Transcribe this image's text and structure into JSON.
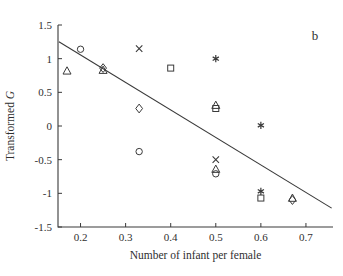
{
  "panel": {
    "label": "b"
  },
  "chart_data": {
    "type": "scatter",
    "title": "",
    "xlabel": "Number of infant per female",
    "ylabel": "Transformed G",
    "ylabel_plain": "Transformed",
    "ylabel_italic": "G",
    "xlim": [
      0.15,
      0.76
    ],
    "ylim": [
      -1.5,
      1.5
    ],
    "xticks": [
      0.2,
      0.3,
      0.4,
      0.5,
      0.6,
      0.7
    ],
    "xticklabels": [
      "0.2",
      "0.3",
      "0.4",
      "0.5",
      "0.6",
      "0.7"
    ],
    "yticks": [
      -1.5,
      -1,
      -0.5,
      0,
      0.5,
      1,
      1.5
    ],
    "yticklabels": [
      "-1.5",
      "-1",
      "-0.5",
      "0",
      "0.5",
      "1",
      "1.5"
    ],
    "grid": false,
    "legend": false,
    "points": [
      {
        "x": 0.17,
        "y": 0.82,
        "marker": "triangle"
      },
      {
        "x": 0.2,
        "y": 1.14,
        "marker": "circle"
      },
      {
        "x": 0.25,
        "y": 0.86,
        "marker": "diamond"
      },
      {
        "x": 0.25,
        "y": 0.83,
        "marker": "triangle"
      },
      {
        "x": 0.33,
        "y": 1.15,
        "marker": "cross"
      },
      {
        "x": 0.33,
        "y": 0.26,
        "marker": "diamond"
      },
      {
        "x": 0.33,
        "y": -0.38,
        "marker": "circle"
      },
      {
        "x": 0.4,
        "y": 0.86,
        "marker": "square"
      },
      {
        "x": 0.5,
        "y": 1.0,
        "marker": "asterisk"
      },
      {
        "x": 0.5,
        "y": 0.31,
        "marker": "triangle"
      },
      {
        "x": 0.5,
        "y": 0.26,
        "marker": "square"
      },
      {
        "x": 0.5,
        "y": -0.5,
        "marker": "cross"
      },
      {
        "x": 0.5,
        "y": -0.64,
        "marker": "triangle"
      },
      {
        "x": 0.5,
        "y": -0.71,
        "marker": "circle"
      },
      {
        "x": 0.6,
        "y": 0.01,
        "marker": "asterisk"
      },
      {
        "x": 0.6,
        "y": -0.97,
        "marker": "asterisk"
      },
      {
        "x": 0.6,
        "y": -1.07,
        "marker": "square"
      },
      {
        "x": 0.67,
        "y": -1.07,
        "marker": "triangle"
      },
      {
        "x": 0.67,
        "y": -1.1,
        "marker": "diamond"
      }
    ],
    "fit_line": {
      "x_start": 0.152,
      "y_start": 1.25,
      "x_end": 0.757,
      "y_end": -1.22
    }
  }
}
